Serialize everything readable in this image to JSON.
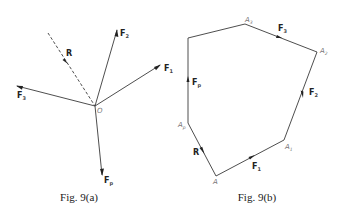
{
  "figure_a": {
    "caption": "Fig. 9(a)",
    "origin_label": "O",
    "forces": [
      {
        "id": "F1",
        "symbol": "F",
        "subscript": "1"
      },
      {
        "id": "F2",
        "symbol": "F",
        "subscript": "2"
      },
      {
        "id": "F3",
        "symbol": "F",
        "subscript": "3"
      },
      {
        "id": "Fp",
        "symbol": "F",
        "subscript": "p"
      }
    ],
    "resultant": {
      "symbol": "R",
      "style": "dashed"
    }
  },
  "figure_b": {
    "caption": "Fig. 9(b)",
    "vertices": [
      {
        "id": "A",
        "symbol": "A",
        "subscript": ""
      },
      {
        "id": "A1",
        "symbol": "A",
        "subscript": "1"
      },
      {
        "id": "A2",
        "symbol": "A",
        "subscript": "2"
      },
      {
        "id": "A3",
        "symbol": "A",
        "subscript": "3"
      },
      {
        "id": "Ap",
        "symbol": "A",
        "subscript": "p"
      }
    ],
    "sides": [
      {
        "id": "F1",
        "symbol": "F",
        "subscript": "1"
      },
      {
        "id": "F2",
        "symbol": "F",
        "subscript": "2"
      },
      {
        "id": "F3",
        "symbol": "F",
        "subscript": "3"
      },
      {
        "id": "Fp",
        "symbol": "F",
        "subscript": "p"
      }
    ],
    "closing_side": {
      "symbol": "R"
    }
  }
}
